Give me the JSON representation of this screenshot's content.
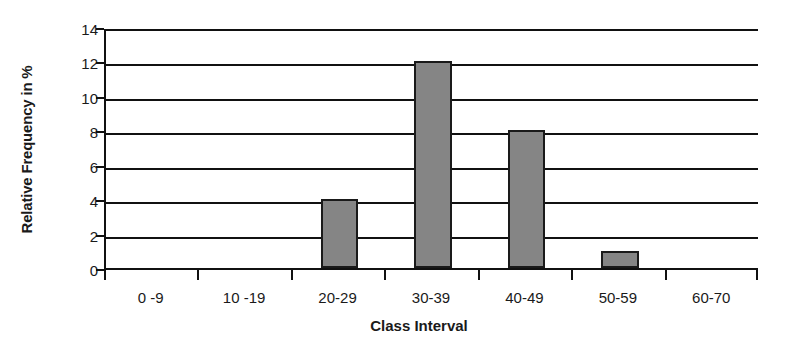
{
  "chart_data": {
    "type": "bar",
    "title": "",
    "subtitle": "",
    "xlabel": "Class Interval",
    "ylabel": "Relative Frequency in %",
    "categories": [
      "0 -9",
      "10 -19",
      "20-29",
      "30-39",
      "40-49",
      "50-59",
      "60-70"
    ],
    "values": [
      0,
      0,
      4,
      12,
      8,
      1,
      0
    ],
    "ylim": [
      0,
      14
    ],
    "ytick_step": 2,
    "yticks": [
      0,
      2,
      4,
      6,
      8,
      10,
      12,
      14
    ],
    "ytick_labels": [
      "0",
      "2",
      "4",
      "6",
      "8",
      "10",
      "12",
      "14"
    ],
    "grid": "horizontal",
    "legend": "none",
    "bar_fill_color": "#858585",
    "bar_border_color": "#1a1a1a",
    "axis_color": "#111111",
    "background_color": "#ffffff"
  }
}
